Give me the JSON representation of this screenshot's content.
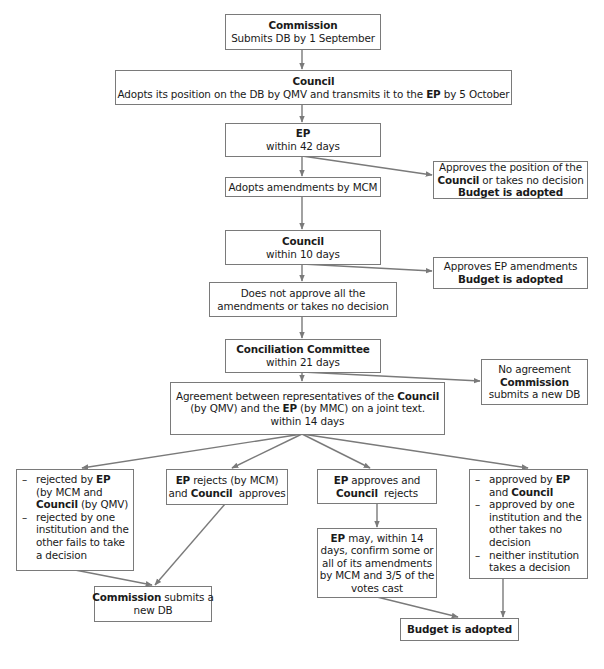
{
  "diagram": {
    "type": "flowchart",
    "colors": {
      "border": "#7a7a7a",
      "arrow": "#7a7a7a",
      "text": "#1a1a1a",
      "background": "#ffffff"
    }
  },
  "nodes": {
    "commission_submit": {
      "title": "Commission",
      "text": "Submits DB by 1 September"
    },
    "council_adopt": {
      "title": "Council",
      "text_before": "Adopts its position on the DB by QMV and transmits it to the ",
      "bold": "EP",
      "text_after": " by 5 October"
    },
    "ep_42": {
      "title": "EP",
      "text": "within 42 days"
    },
    "ep_approves_position": {
      "line1": "Approves the position of the",
      "bold": "Council",
      "line2_after": " or takes no decision",
      "result": "Budget is adopted"
    },
    "ep_adopts_amendments": {
      "text": "Adopts amendments by MCM"
    },
    "council_10": {
      "title": "Council",
      "text": "within 10 days"
    },
    "council_approves_amendments": {
      "text": "Approves EP amendments",
      "result": "Budget is adopted"
    },
    "council_not_approve": {
      "line1": "Does not approve all the",
      "line2": "amendments or takes no decision"
    },
    "conciliation": {
      "title": "Conciliation Committee",
      "text": "within 21 days"
    },
    "no_agreement": {
      "line1": "No agreement",
      "bold": "Commission",
      "line3": "submits a new DB"
    },
    "agreement": {
      "line1_before": "Agreement between representatives of the ",
      "line1_bold": "Council",
      "line2_before": "(by QMV) and the ",
      "line2_bold": "EP",
      "line2_after": " (by MMC) on a joint text.",
      "line3": "within 14 days"
    },
    "rejected_list": {
      "item1_a": "rejected by ",
      "item1_b": "EP",
      "item1_c": " (by MCM and ",
      "item1_d": "Council",
      "item1_e": " (by QMV)",
      "item2": "rejected by one institution and the other fails to take a decision"
    },
    "ep_rejects": {
      "bold1": "EP",
      "text1": " rejects (by MCM)",
      "text2a": "and ",
      "bold2": "Council",
      "text2b": "  approves"
    },
    "ep_approves": {
      "bold1": "EP",
      "text1": " approves and",
      "bold2": "Council",
      "text2": "  rejects"
    },
    "approved_list": {
      "item1_a": "approved by ",
      "item1_b": "EP",
      "item1_c": " and ",
      "item1_d": "Council",
      "item2": "approved by one institution and the other takes no decision",
      "item3": "neither institution takes a decision"
    },
    "ep_may": {
      "bold": "EP",
      "text1": " may, within 14",
      "line2": "days, confirm some or",
      "line3": "all of its amendments",
      "line4": "by MCM and 3/5 of the",
      "line5": "votes cast"
    },
    "commission_new_db": {
      "bold": "Commission",
      "text1": " submits a",
      "line2": "new DB"
    },
    "budget_adopted_final": {
      "text": "Budget is adopted"
    }
  },
  "edges": [
    [
      "commission_submit",
      "council_adopt"
    ],
    [
      "council_adopt",
      "ep_42"
    ],
    [
      "ep_42",
      "ep_approves_position"
    ],
    [
      "ep_42",
      "ep_adopts_amendments"
    ],
    [
      "ep_adopts_amendments",
      "council_10"
    ],
    [
      "council_10",
      "council_approves_amendments"
    ],
    [
      "council_10",
      "council_not_approve"
    ],
    [
      "council_not_approve",
      "conciliation"
    ],
    [
      "conciliation",
      "no_agreement"
    ],
    [
      "conciliation",
      "agreement"
    ],
    [
      "agreement",
      "rejected_list"
    ],
    [
      "agreement",
      "ep_rejects"
    ],
    [
      "agreement",
      "ep_approves"
    ],
    [
      "agreement",
      "approved_list"
    ],
    [
      "rejected_list",
      "commission_new_db"
    ],
    [
      "ep_rejects",
      "commission_new_db"
    ],
    [
      "ep_approves",
      "ep_may"
    ],
    [
      "ep_may",
      "budget_adopted_final"
    ],
    [
      "approved_list",
      "budget_adopted_final"
    ]
  ]
}
